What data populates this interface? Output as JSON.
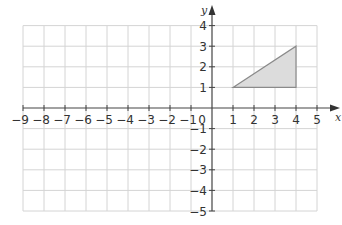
{
  "chart_data": {
    "type": "coordinate_grid",
    "title": "",
    "xlabel": "x",
    "ylabel": "y",
    "xlim": [
      -9,
      5
    ],
    "ylim": [
      -5,
      4
    ],
    "grid": true,
    "x_ticks": [
      -9,
      -8,
      -7,
      -6,
      -5,
      -4,
      -3,
      -2,
      -1,
      1,
      2,
      3,
      4,
      5
    ],
    "y_ticks": [
      4,
      3,
      2,
      1,
      -1,
      -2,
      -3,
      -4,
      -5
    ],
    "origin_label": "0",
    "shapes": [
      {
        "name": "triangle",
        "vertices": [
          [
            1,
            1
          ],
          [
            4,
            3
          ],
          [
            4,
            1
          ]
        ],
        "fill": "#dcdcdc",
        "stroke": "#8a8a8a"
      }
    ]
  },
  "labels": {
    "x_axis": "x",
    "y_axis": "y",
    "origin": "0",
    "x_ticks": [
      "−9",
      "−8",
      "−7",
      "−6",
      "−5",
      "−4",
      "−3",
      "−2",
      "−1",
      "1",
      "2",
      "3",
      "4",
      "5"
    ],
    "y_ticks": [
      "4",
      "3",
      "2",
      "1",
      "−1",
      "−2",
      "−3",
      "−4",
      "−5"
    ]
  }
}
